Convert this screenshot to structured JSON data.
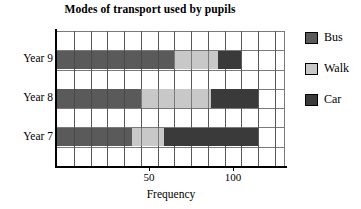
{
  "chart_data": {
    "type": "bar",
    "orientation": "horizontal",
    "stacked": true,
    "title": "Modes of transport used by pupils",
    "xlabel": "Frequency",
    "ylabel": "",
    "categories": [
      "Year 9",
      "Year 8",
      "Year 7"
    ],
    "xlim": [
      0,
      136
    ],
    "xticks": [
      50,
      100
    ],
    "xtick_labels": [
      "50",
      "100"
    ],
    "grid": true,
    "grid_step": 10,
    "legend_position": "right",
    "series": [
      {
        "name": "Bus",
        "color": "#5a5a5a",
        "values": [
          70,
          50,
          45
        ]
      },
      {
        "name": "Walk",
        "color": "#c8c8c8",
        "values": [
          26,
          42,
          19
        ]
      },
      {
        "name": "Car",
        "color": "#3a3a3a",
        "values": [
          14,
          28,
          56
        ]
      }
    ],
    "cumulative_ends": {
      "Year 9": [
        70,
        96,
        110
      ],
      "Year 8": [
        50,
        92,
        120
      ],
      "Year 7": [
        45,
        64,
        120
      ]
    }
  },
  "legend": {
    "items": [
      {
        "label": "Bus",
        "color": "#5a5a5a"
      },
      {
        "label": "Walk",
        "color": "#c8c8c8"
      },
      {
        "label": "Car",
        "color": "#3a3a3a"
      }
    ]
  },
  "axis": {
    "x_label": "Frequency",
    "tick_50": "50",
    "tick_100": "100"
  },
  "categories": {
    "year9": "Year 9",
    "year8": "Year 8",
    "year7": "Year 7"
  },
  "title": "Modes of transport used by pupils"
}
